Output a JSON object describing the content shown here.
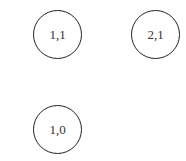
{
  "diagram": {
    "nodes": [
      {
        "label": "1,1",
        "cx": 57,
        "cy": 34
      },
      {
        "label": "2,1",
        "cx": 155,
        "cy": 34
      },
      {
        "label": "1,0",
        "cx": 57,
        "cy": 129
      }
    ],
    "stroke_color": "#222222",
    "background": "#ffffff"
  }
}
